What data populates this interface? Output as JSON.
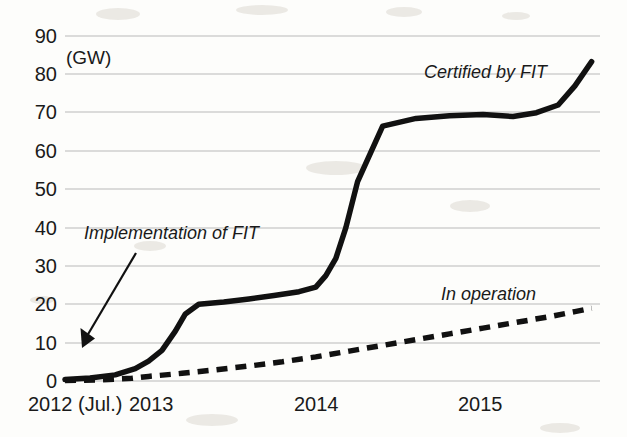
{
  "chart_data": {
    "type": "line",
    "title": "",
    "subtitle": "",
    "xlabel": "",
    "ylabel": "",
    "unit_label": "(GW)",
    "grid": true,
    "legend_position": "inline-labels",
    "xlim": [
      0,
      3.2
    ],
    "ylim": [
      0,
      90
    ],
    "y_ticks": [
      0,
      10,
      20,
      30,
      40,
      50,
      60,
      70,
      80,
      90
    ],
    "x_tick_labels": [
      "2012 (Jul.)",
      "2013",
      "2014",
      "2015"
    ],
    "x_tick_values": [
      0.0,
      0.5,
      1.5,
      2.5
    ],
    "series": [
      {
        "name": "Certified by FIT",
        "style": "solid",
        "x": [
          0.0,
          0.15,
          0.3,
          0.42,
          0.5,
          0.58,
          0.66,
          0.72,
          0.8,
          0.95,
          1.1,
          1.25,
          1.4,
          1.5,
          1.56,
          1.62,
          1.68,
          1.75,
          1.9,
          2.1,
          2.3,
          2.5,
          2.68,
          2.82,
          2.95,
          3.05,
          3.15
        ],
        "values": [
          0.4,
          0.8,
          1.6,
          3.2,
          5.2,
          8.0,
          13.0,
          17.5,
          20.0,
          20.6,
          21.4,
          22.3,
          23.3,
          24.5,
          27.5,
          32.0,
          40.0,
          52.0,
          66.5,
          68.5,
          69.2,
          69.5,
          69.0,
          70.0,
          72.0,
          77.0,
          83.3
        ]
      },
      {
        "name": "In operation",
        "style": "dashed",
        "x": [
          0.0,
          0.2,
          0.4,
          0.5,
          0.7,
          0.9,
          1.1,
          1.3,
          1.5,
          1.7,
          1.9,
          2.1,
          2.3,
          2.5,
          2.7,
          2.9,
          3.05,
          3.15
        ],
        "values": [
          0.1,
          0.3,
          0.7,
          1.2,
          2.0,
          2.9,
          3.9,
          5.0,
          6.3,
          7.8,
          9.3,
          10.8,
          12.3,
          13.8,
          15.3,
          16.8,
          18.1,
          19.0
        ]
      }
    ],
    "annotations": [
      {
        "text": "Implementation of FIT",
        "type": "arrow-callout",
        "points_to_x": 0.03,
        "points_to_y": 9.5
      },
      {
        "text": "Certified by FIT",
        "type": "series-label"
      },
      {
        "text": "In operation",
        "type": "series-label"
      }
    ],
    "colors": {
      "line": "#111111",
      "grid": "#b9b9b9",
      "background": "#fdfdfb",
      "text": "#1a1a1a"
    }
  }
}
